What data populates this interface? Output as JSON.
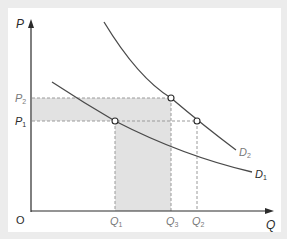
{
  "diagram": {
    "type": "demand-shift",
    "colors": {
      "background": "#ececec",
      "panel": "#ffffff",
      "axis": "#2b2b2b",
      "curve": "#4a4a4a",
      "shading": "#e2e2e2",
      "dashed": "#9a9a9a",
      "label": "#2b2b2b",
      "subtle_label": "#7a7a7a"
    },
    "axes": {
      "y_label": "P",
      "x_label": "Q",
      "origin_label": "O"
    },
    "price_levels": [
      {
        "id": "P2",
        "base": "P",
        "sub": "2"
      },
      {
        "id": "P1",
        "base": "P",
        "sub": "1"
      }
    ],
    "quantity_levels": [
      {
        "id": "Q1",
        "base": "Q",
        "sub": "1"
      },
      {
        "id": "Q3",
        "base": "Q",
        "sub": "3"
      },
      {
        "id": "Q2",
        "base": "Q",
        "sub": "2"
      }
    ],
    "curves": [
      {
        "id": "D2",
        "base": "D",
        "sub": "2"
      },
      {
        "id": "D1",
        "base": "D",
        "sub": "1"
      }
    ],
    "points": [
      {
        "label": "(Q1, P1) on D1"
      },
      {
        "label": "(Q3, P2) on D2"
      },
      {
        "label": "(Q2, P1) on D2"
      }
    ]
  }
}
